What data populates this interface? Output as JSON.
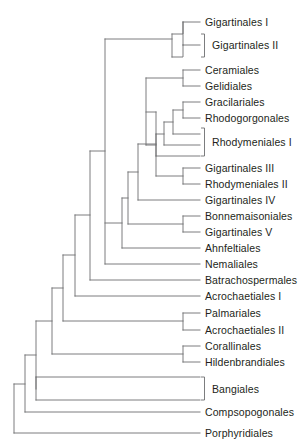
{
  "figure": {
    "type": "cladogram",
    "title": "",
    "background_color": "#ffffff",
    "line_color": "#6d6e71",
    "text_color": "#231f20",
    "width": 306,
    "height": 443
  },
  "chart_data": {
    "type": "diagram",
    "subtype": "phylogenetic-cladogram",
    "title": "",
    "xlabel": "",
    "ylabel": "",
    "taxa": [
      {
        "id": "gigartinales_i",
        "label": "Gigartinales I",
        "y": 22,
        "tip_x": 200,
        "bracket": false
      },
      {
        "id": "gigartinales_ii",
        "label": "Gigartinales II",
        "y": 45,
        "tip_x": 200,
        "bracket": true
      },
      {
        "id": "ceramiales",
        "label": "Ceramiales",
        "y": 70,
        "tip_x": 200,
        "bracket": false
      },
      {
        "id": "gelidiales",
        "label": "Gelidiales",
        "y": 86,
        "tip_x": 200,
        "bracket": false
      },
      {
        "id": "gracilariales",
        "label": "Gracilariales",
        "y": 102,
        "tip_x": 200,
        "bracket": false
      },
      {
        "id": "rhodogorgonales",
        "label": "Rhodogorgonales",
        "y": 118,
        "tip_x": 200,
        "bracket": false
      },
      {
        "id": "rhodymeniales_i",
        "label": "Rhodymeniales I",
        "y": 142,
        "tip_x": 200,
        "bracket": true
      },
      {
        "id": "gigartinales_iii",
        "label": "Gigartinales III",
        "y": 168,
        "tip_x": 200,
        "bracket": false
      },
      {
        "id": "rhodymeniales_ii",
        "label": "Rhodymeniales II",
        "y": 184,
        "tip_x": 200,
        "bracket": false
      },
      {
        "id": "gigartinales_iv",
        "label": "Gigartinales IV",
        "y": 200,
        "tip_x": 200,
        "bracket": false
      },
      {
        "id": "bonnemaisoniales",
        "label": "Bonnemaisoniales",
        "y": 216,
        "tip_x": 200,
        "bracket": false
      },
      {
        "id": "gigartinales_v",
        "label": "Gigartinales V",
        "y": 232,
        "tip_x": 200,
        "bracket": false
      },
      {
        "id": "ahnfeltiales",
        "label": "Ahnfeltiales",
        "y": 248,
        "tip_x": 200,
        "bracket": false
      },
      {
        "id": "nemaliales",
        "label": "Nemaliales",
        "y": 264,
        "tip_x": 200,
        "bracket": false
      },
      {
        "id": "batrachospermales",
        "label": "Batrachospermales",
        "y": 280,
        "tip_x": 200,
        "bracket": false
      },
      {
        "id": "acrochaetiales_i",
        "label": "Acrochaetiales I",
        "y": 296,
        "tip_x": 200,
        "bracket": false
      },
      {
        "id": "palmariales",
        "label": "Palmariales",
        "y": 313,
        "tip_x": 200,
        "bracket": false
      },
      {
        "id": "acrochaetiales_ii",
        "label": "Acrochaetiales II",
        "y": 330,
        "tip_x": 200,
        "bracket": false
      },
      {
        "id": "corallinales",
        "label": "Corallinales",
        "y": 346,
        "tip_x": 200,
        "bracket": false
      },
      {
        "id": "hildenbrandiales",
        "label": "Hildenbrandiales",
        "y": 362,
        "tip_x": 200,
        "bracket": false
      },
      {
        "id": "bangiales",
        "label": "Bangiales",
        "y": 389,
        "tip_x": 200,
        "bracket": true
      },
      {
        "id": "compsopogonales",
        "label": "Compsopogonales",
        "y": 412,
        "tip_x": 200,
        "bracket": false
      },
      {
        "id": "porphyridiales",
        "label": "Porphyridiales",
        "y": 433,
        "tip_x": 200,
        "bracket": false
      }
    ],
    "label_x": 205,
    "bracket_x": 201,
    "brackets": [
      {
        "for": "gigartinales_ii",
        "y_top": 34,
        "y_bottom": 57
      },
      {
        "for": "rhodymeniales_i",
        "y_top": 128,
        "y_bottom": 156
      },
      {
        "for": "bangiales",
        "y_top": 377,
        "y_bottom": 400
      }
    ],
    "internal_nodes": [
      {
        "id": "n_gig1_split",
        "x": 183,
        "children_y": [
          22,
          34
        ]
      },
      {
        "id": "n_gig_clade",
        "x": 172,
        "children_y": [
          28,
          50
        ]
      },
      {
        "id": "n_gig2_split",
        "x": 183,
        "children_y": [
          45,
          57
        ]
      },
      {
        "id": "n_cer_gel",
        "x": 183,
        "children_y": [
          70,
          86
        ]
      },
      {
        "id": "n_gra_rho",
        "x": 183,
        "children_y": [
          102,
          118
        ]
      },
      {
        "id": "n_rhody1_a",
        "x": 173,
        "children_y": [
          110,
          134
        ]
      },
      {
        "id": "n_rhody1_b",
        "x": 164,
        "children_y": [
          122,
          145
        ]
      },
      {
        "id": "n_rhody1_c",
        "x": 156,
        "children_y": [
          134,
          156
        ]
      },
      {
        "id": "n_core1",
        "x": 146,
        "children_y": [
          78,
          145
        ]
      },
      {
        "id": "n_gig3_rhod2",
        "x": 183,
        "children_y": [
          168,
          184
        ]
      },
      {
        "id": "n_core2",
        "x": 156,
        "children_y": [
          112,
          176
        ]
      },
      {
        "id": "n_core3",
        "x": 138,
        "children_y": [
          144,
          200
        ]
      },
      {
        "id": "n_bon_gig5",
        "x": 183,
        "children_y": [
          216,
          232
        ]
      },
      {
        "id": "n_core4",
        "x": 128,
        "children_y": [
          172,
          224
        ]
      },
      {
        "id": "n_core5",
        "x": 122,
        "children_y": [
          198,
          248
        ]
      },
      {
        "id": "n_core6",
        "x": 105,
        "children_y": [
          39,
          264
        ]
      },
      {
        "id": "n_core7",
        "x": 90,
        "children_y": [
          151,
          280
        ]
      },
      {
        "id": "n_core8",
        "x": 75,
        "children_y": [
          215,
          296
        ]
      },
      {
        "id": "n_palm",
        "x": 183,
        "children_y": [
          313,
          330
        ]
      },
      {
        "id": "n_core9",
        "x": 63,
        "children_y": [
          255,
          321
        ]
      },
      {
        "id": "n_cor_hild",
        "x": 183,
        "children_y": [
          346,
          362
        ]
      },
      {
        "id": "n_core10",
        "x": 52,
        "children_y": [
          288,
          354
        ]
      },
      {
        "id": "n_bang_split",
        "x": 178,
        "children_y": [
          377,
          400
        ]
      },
      {
        "id": "n_core11",
        "x": 36,
        "children_y": [
          321,
          389
        ]
      },
      {
        "id": "n_core12",
        "x": 25,
        "children_y": [
          355,
          412
        ]
      },
      {
        "id": "n_root",
        "x": 14,
        "children_y": [
          384,
          433
        ]
      }
    ]
  }
}
